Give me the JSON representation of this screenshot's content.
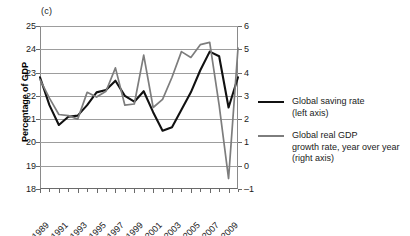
{
  "panel": {
    "label": "(c)"
  },
  "axes": {
    "ylabel": "Percentage of GDP",
    "left_ticks": [
      "25",
      "24",
      "23",
      "22",
      "21",
      "20",
      "19",
      "18"
    ],
    "right_ticks": [
      "6",
      "5",
      "4",
      "3",
      "2",
      "1",
      "0",
      "–1"
    ],
    "x_ticks": [
      "1989",
      "1991",
      "1993",
      "1995",
      "1997",
      "1999",
      "2001",
      "2003",
      "2005",
      "2007",
      "2009"
    ]
  },
  "legend": {
    "entries": [
      {
        "color": "#111111",
        "line1": "Global saving rate",
        "line2": "(left axis)",
        "line3": ""
      },
      {
        "color": "#7d7d7d",
        "line1": "Global real GDP",
        "line2": "growth rate, year over year",
        "line3": "(right axis)"
      }
    ]
  },
  "chart_data": {
    "type": "line",
    "title": "(c)",
    "xlabel": "",
    "ylabel": "Percentage of GDP",
    "y2label": "",
    "grid": true,
    "legend_position": "right",
    "ylim": [
      18,
      25
    ],
    "y2lim": [
      -1,
      6
    ],
    "x": [
      1989,
      1990,
      1991,
      1992,
      1993,
      1994,
      1995,
      1996,
      1997,
      1998,
      1999,
      2000,
      2001,
      2002,
      2003,
      2004,
      2005,
      2006,
      2007,
      2008,
      2009,
      2010
    ],
    "series": [
      {
        "name": "Global saving rate (left axis)",
        "axis": "left",
        "units": "Percentage of GDP",
        "color": "#111111",
        "values": [
          22.8,
          21.6,
          20.75,
          21.1,
          21.15,
          21.6,
          22.15,
          22.25,
          22.65,
          22.0,
          21.75,
          22.2,
          21.3,
          20.5,
          20.65,
          21.4,
          22.15,
          23.1,
          23.9,
          23.7,
          21.5,
          22.8
        ]
      },
      {
        "name": "Global real GDP growth rate, year over year (right axis)",
        "axis": "right",
        "units": "Percent",
        "color": "#7d7d7d",
        "values": [
          3.7,
          2.9,
          2.2,
          2.15,
          2.0,
          3.15,
          2.95,
          3.2,
          4.2,
          2.6,
          2.65,
          4.75,
          2.5,
          2.85,
          3.8,
          4.9,
          4.65,
          5.2,
          5.3,
          2.6,
          -0.55,
          5.05
        ]
      }
    ]
  }
}
